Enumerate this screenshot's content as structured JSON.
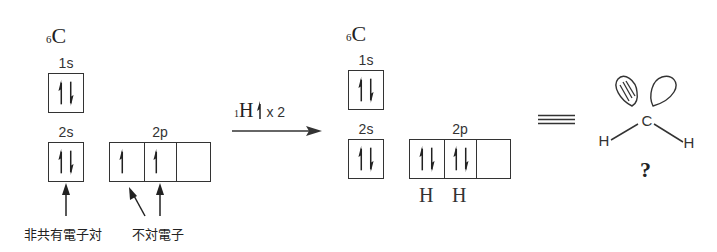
{
  "left": {
    "atom": {
      "symbol": "C",
      "atomic_number": "6"
    },
    "orbitals": {
      "s1": {
        "label": "1s",
        "electrons": "up-down"
      },
      "s2": {
        "label": "2s",
        "electrons": "up-down"
      },
      "p2": {
        "label": "2p",
        "boxes": [
          "up",
          "up",
          "empty"
        ]
      }
    },
    "annotations": {
      "lone_pair": "非共有電子対",
      "unpaired": "不対電子"
    }
  },
  "reaction": {
    "reagent_symbol": "H",
    "reagent_number": "1",
    "multiplier": "x 2"
  },
  "right": {
    "atom": {
      "symbol": "C",
      "atomic_number": "6"
    },
    "orbitals": {
      "s1": {
        "label": "1s",
        "electrons": "up-down"
      },
      "s2": {
        "label": "2s",
        "electrons": "up-down"
      },
      "p2": {
        "label": "2p",
        "boxes": [
          "up-down",
          "up-down",
          "empty"
        ]
      }
    },
    "bond_labels": [
      "H",
      "H"
    ]
  },
  "equivalence_symbol": "≡",
  "molecule": {
    "center": "C",
    "left_atom": "H",
    "right_atom": "H",
    "question": "?"
  }
}
